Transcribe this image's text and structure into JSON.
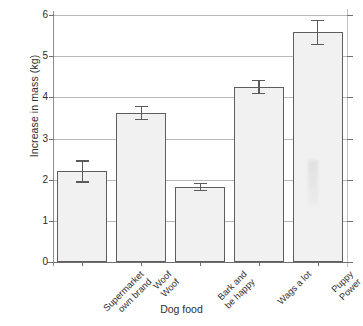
{
  "chart_data": {
    "type": "bar",
    "title": "",
    "xlabel": "Dog food",
    "ylabel": "Increase in mass (kg)",
    "categories": [
      "Supermarket own brand",
      "Woof Woof",
      "Bark and be happy",
      "Wags a lot",
      "Puppy Power"
    ],
    "category_lines": [
      [
        "Supermarket",
        "own brand"
      ],
      [
        "Woof",
        "Woof"
      ],
      [
        "Bark and",
        "be happy"
      ],
      [
        "Wags a lot"
      ],
      [
        "Puppy",
        "Power"
      ]
    ],
    "values": [
      2.2,
      3.62,
      1.82,
      4.25,
      5.58
    ],
    "errors": [
      0.27,
      0.17,
      0.1,
      0.17,
      0.31
    ],
    "ylim": [
      0,
      6
    ],
    "yticks": [
      0,
      1,
      2,
      3,
      4,
      5,
      6
    ],
    "ytick_labels": [
      "0",
      "1",
      "2",
      "3",
      "4",
      "5",
      "6"
    ],
    "grid": true,
    "legend": false,
    "bar_fill_color": "#f1f1f1",
    "bar_edge_color": "#5d5d5d",
    "error_color": "#5a5a5a",
    "grid_color": "#b9b9b9"
  }
}
